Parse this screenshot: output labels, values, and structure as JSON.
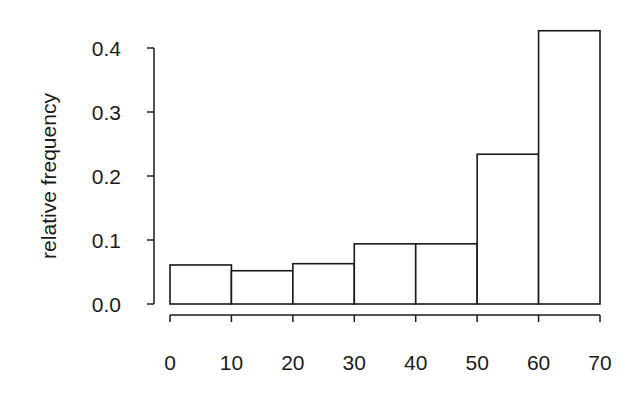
{
  "chart_data": {
    "type": "bar",
    "subtype": "histogram",
    "title": "",
    "xlabel": "",
    "ylabel": "relative frequency",
    "bins": [
      [
        0,
        10
      ],
      [
        10,
        20
      ],
      [
        20,
        30
      ],
      [
        30,
        40
      ],
      [
        40,
        50
      ],
      [
        50,
        60
      ],
      [
        60,
        70
      ]
    ],
    "categories": [
      "0-10",
      "10-20",
      "20-30",
      "30-40",
      "40-50",
      "50-60",
      "60-70"
    ],
    "values": [
      0.061,
      0.052,
      0.063,
      0.094,
      0.094,
      0.234,
      0.427
    ],
    "xlim": [
      0,
      70
    ],
    "ylim": [
      0,
      0.4
    ],
    "x_ticks": [
      0,
      10,
      20,
      30,
      40,
      50,
      60,
      70
    ],
    "x_tick_labels": [
      "0",
      "10",
      "20",
      "30",
      "40",
      "50",
      "60",
      "70"
    ],
    "y_ticks": [
      0,
      0.1,
      0.2,
      0.3,
      0.4
    ],
    "y_tick_labels": [
      "0.0",
      "0.1",
      "0.2",
      "0.3",
      "0.4"
    ],
    "grid": false,
    "legend": null,
    "colors": {
      "bar_fill": "#ffffff",
      "bar_stroke": "#1a1a1a",
      "axis": "#1a1a1a"
    }
  }
}
